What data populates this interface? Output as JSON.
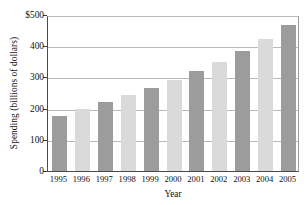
{
  "chart_data": {
    "type": "bar",
    "title": "",
    "xlabel": "Year",
    "ylabel": "Spending (billions of dollars)",
    "categories": [
      "1995",
      "1996",
      "1997",
      "1998",
      "1999",
      "2000",
      "2001",
      "2002",
      "2003",
      "2004",
      "2005"
    ],
    "values": [
      176,
      199,
      221,
      244,
      266,
      292,
      320,
      350,
      385,
      423,
      468
    ],
    "ylim": [
      0,
      500
    ],
    "ytick_values": [
      0,
      100,
      200,
      300,
      400,
      500
    ],
    "ytick_labels": [
      "0",
      "100",
      "200",
      "300",
      "400",
      "$500"
    ],
    "grid": true,
    "legend": "none",
    "series": [
      {
        "name": "Spending",
        "values": [
          176,
          199,
          221,
          244,
          266,
          292,
          320,
          350,
          385,
          423,
          468
        ]
      }
    ],
    "bar_colors": [
      "#9c9c9c",
      "#dadada",
      "#9c9c9c",
      "#dadada",
      "#9c9c9c",
      "#dadada",
      "#9c9c9c",
      "#dadada",
      "#9c9c9c",
      "#dadada",
      "#9c9c9c"
    ],
    "colors": {
      "bar_dark": "#9c9c9c",
      "bar_light": "#dadada",
      "axis": "#4a4a4a",
      "gridline": "#b9b9b9",
      "background": "#ffffff",
      "text": "#111111"
    }
  }
}
